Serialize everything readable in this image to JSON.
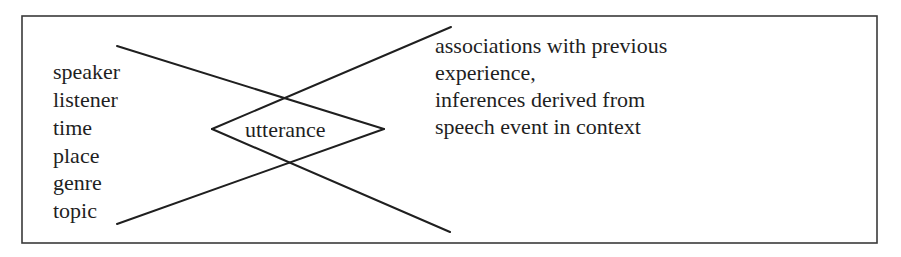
{
  "diagram": {
    "frame": {
      "x": 22,
      "y": 16,
      "width": 855,
      "height": 227,
      "stroke": "#3a3a3a"
    },
    "line_color": "#1f1f1f",
    "left_labels": [
      "speaker",
      "listener",
      "time",
      "place",
      "genre",
      "topic"
    ],
    "center_label": "utterance",
    "right_labels": [
      "associations with previous",
      "experience,",
      "inferences derived from",
      "speech event in context"
    ],
    "lines": [
      {
        "x1": 117,
        "y1": 46,
        "x2": 384,
        "y2": 129
      },
      {
        "x1": 117,
        "y1": 224,
        "x2": 384,
        "y2": 129
      },
      {
        "x1": 212,
        "y1": 129,
        "x2": 451,
        "y2": 27
      },
      {
        "x1": 212,
        "y1": 129,
        "x2": 450,
        "y2": 232
      }
    ]
  }
}
